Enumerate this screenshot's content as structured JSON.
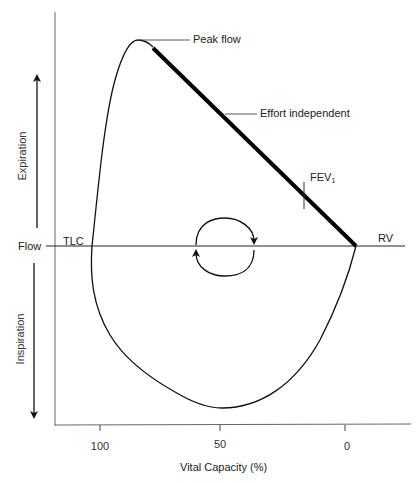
{
  "diagram": {
    "type": "flow-volume-loop",
    "axes": {
      "y_label": "Flow",
      "x_label": "Vital Capacity (%)",
      "x_ticks": [
        "100",
        "50",
        "0"
      ],
      "expiration_label": "Expiration",
      "inspiration_label": "Inspiration"
    },
    "annotations": {
      "peak_flow": "Peak flow",
      "effort_independent": "Effort independent",
      "fev1_main": "FEV",
      "fev1_sub": "1",
      "tlc": "TLC",
      "rv": "RV"
    },
    "cycle_arrows": "clockwise-loop-icon",
    "colors": {
      "line": "#111111",
      "axis": "#555555",
      "text": "#222222"
    }
  }
}
